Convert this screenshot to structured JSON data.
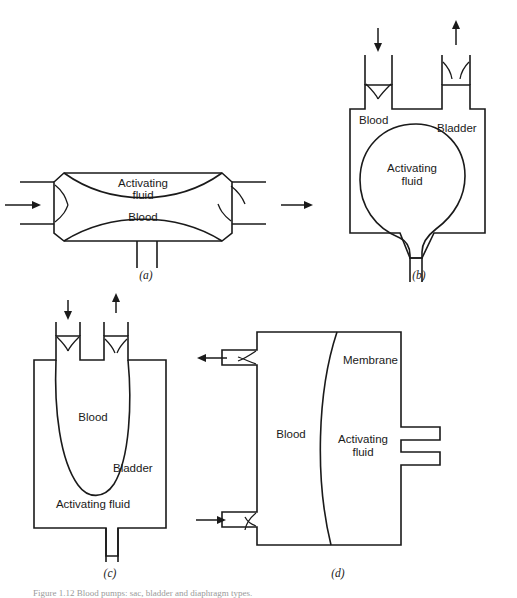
{
  "figure": {
    "panels": [
      {
        "id": "a",
        "label": "(a)",
        "type": "sac-pump-horizontal",
        "texts": {
          "activating_fluid": "Activating\nfluid",
          "activating_fluid_line1": "Activating",
          "activating_fluid_line2": "fluid",
          "blood": "Blood"
        },
        "flow": {
          "inlet_direction": "right",
          "outlet_direction": "right"
        }
      },
      {
        "id": "b",
        "label": "(b)",
        "type": "bladder-pump-fluid-inside",
        "texts": {
          "blood": "Blood",
          "bladder": "Bladder",
          "activating_fluid_line1": "Activating",
          "activating_fluid_line2": "fluid"
        },
        "flow": {
          "inlet_direction": "down",
          "outlet_direction": "up"
        }
      },
      {
        "id": "c",
        "label": "(c)",
        "type": "bladder-pump-blood-inside",
        "texts": {
          "blood": "Blood",
          "bladder": "Bladder",
          "activating_fluid": "Activating  fluid"
        },
        "flow": {
          "inlet_direction": "down",
          "outlet_direction": "up"
        }
      },
      {
        "id": "d",
        "label": "(d)",
        "type": "diaphragm-pump",
        "texts": {
          "membrane": "Membrane",
          "blood": "Blood",
          "activating_fluid_line1": "Activating",
          "activating_fluid_line2": "fluid"
        },
        "flow": {
          "inlet_direction": "right",
          "outlet_direction": "left"
        }
      }
    ],
    "caption": "Figure 1.12 Blood pumps: sac, bladder and diaphragm types."
  },
  "colors": {
    "line": "#1a1a1a",
    "background": "#ffffff",
    "caption": "#9a9a9a"
  }
}
